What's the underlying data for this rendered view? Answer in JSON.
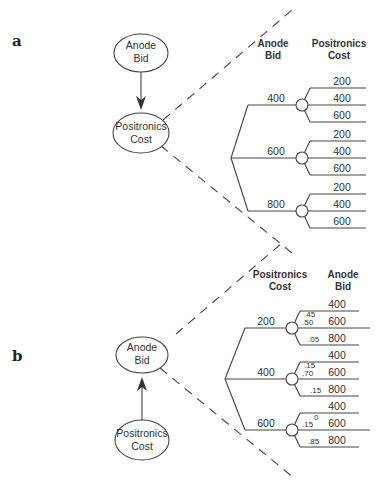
{
  "panel_a": {
    "label": "a",
    "influence": {
      "top_node": {
        "line1": "Anode",
        "line2": "Bid"
      },
      "bottom_node": {
        "line1": "Positronics",
        "line2": "Cost"
      },
      "arrow_direction": "down"
    },
    "tree": {
      "header_decision": {
        "line1": "Anode",
        "line2": "Bid"
      },
      "header_outcome": {
        "line1": "Positronics",
        "line2": "Cost"
      },
      "branches": [
        {
          "label": "400",
          "outcomes": [
            "200",
            "400",
            "600"
          ]
        },
        {
          "label": "600",
          "outcomes": [
            "200",
            "400",
            "600"
          ]
        },
        {
          "label": "800",
          "outcomes": [
            "200",
            "400",
            "600"
          ]
        }
      ]
    }
  },
  "panel_b": {
    "label": "b",
    "influence": {
      "top_node": {
        "line1": "Anode",
        "line2": "Bid"
      },
      "bottom_node": {
        "line1": "Positronics",
        "line2": "Cost"
      },
      "arrow_direction": "up"
    },
    "tree": {
      "header_decision": {
        "line1": "Positronics",
        "line2": "Cost"
      },
      "header_outcome": {
        "line1": "Anode",
        "line2": "Bid"
      },
      "branches": [
        {
          "label": "200",
          "outcomes": [
            "400",
            "600",
            "800"
          ],
          "probs": [
            ".45",
            ".50",
            ".05"
          ]
        },
        {
          "label": "400",
          "outcomes": [
            "400",
            "600",
            "800"
          ],
          "probs": [
            ".15",
            ".70",
            ".15"
          ]
        },
        {
          "label": "600",
          "outcomes": [
            "400",
            "600",
            "800"
          ],
          "probs": [
            "0",
            ".15",
            ".85"
          ]
        }
      ]
    }
  }
}
